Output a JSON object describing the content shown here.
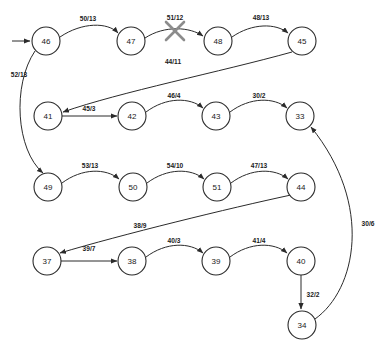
{
  "diagram": {
    "type": "directed-graph",
    "label_format": "cost/capacity",
    "entry_arrow": {
      "target": "46"
    },
    "nodes": [
      {
        "id": "46",
        "label": "46",
        "cx": 46,
        "cy": 41,
        "r": 14
      },
      {
        "id": "47",
        "label": "47",
        "cx": 131,
        "cy": 41,
        "r": 14
      },
      {
        "id": "48",
        "label": "48",
        "cx": 218,
        "cy": 41,
        "r": 14
      },
      {
        "id": "45",
        "label": "45",
        "cx": 302,
        "cy": 41,
        "r": 14
      },
      {
        "id": "41",
        "label": "41",
        "cx": 48,
        "cy": 116,
        "r": 14
      },
      {
        "id": "42",
        "label": "42",
        "cx": 132,
        "cy": 116,
        "r": 14
      },
      {
        "id": "43",
        "label": "43",
        "cx": 216,
        "cy": 116,
        "r": 14
      },
      {
        "id": "33",
        "label": "33",
        "cx": 300,
        "cy": 116,
        "r": 14
      },
      {
        "id": "49",
        "label": "49",
        "cx": 48,
        "cy": 187,
        "r": 14
      },
      {
        "id": "50",
        "label": "50",
        "cx": 133,
        "cy": 187,
        "r": 14
      },
      {
        "id": "51",
        "label": "51",
        "cx": 217,
        "cy": 187,
        "r": 14
      },
      {
        "id": "44",
        "label": "44",
        "cx": 301,
        "cy": 187,
        "r": 14
      },
      {
        "id": "37",
        "label": "37",
        "cx": 47,
        "cy": 261,
        "r": 14
      },
      {
        "id": "38",
        "label": "38",
        "cx": 132,
        "cy": 261,
        "r": 14
      },
      {
        "id": "39",
        "label": "39",
        "cx": 216,
        "cy": 261,
        "r": 14
      },
      {
        "id": "40",
        "label": "40",
        "cx": 301,
        "cy": 261,
        "r": 14
      },
      {
        "id": "34",
        "label": "34",
        "cx": 302,
        "cy": 325,
        "r": 14
      }
    ],
    "edges": [
      {
        "from": "46",
        "to": "47",
        "label": "50/13",
        "lx": 88,
        "ly": 18,
        "path": "M 60,37 C 82,22 108,22 118,33",
        "crossed": false
      },
      {
        "from": "47",
        "to": "48",
        "label": "51/12",
        "lx": 175,
        "ly": 17,
        "path": "M 145,38 C 165,25 190,27 203,36",
        "crossed": true
      },
      {
        "from": "48",
        "to": "45",
        "label": "48/13",
        "lx": 261,
        "ly": 17,
        "path": "M 232,37 C 252,23 276,23 288,33",
        "crossed": false
      },
      {
        "from": "45",
        "to": "41",
        "label": "44/11",
        "lx": 173,
        "ly": 61,
        "path": "M 292,52 C 220,72 120,92 63,112",
        "crossed": false
      },
      {
        "from": "46",
        "to": "49",
        "label": "52/13",
        "lx": 19,
        "ly": 74,
        "path": "M 35,51 C 12,85 16,150 43,173",
        "crossed": false
      },
      {
        "from": "41",
        "to": "42",
        "label": "45/3",
        "lx": 89,
        "ly": 108,
        "path": "M 62,116 L 117,116",
        "crossed": false
      },
      {
        "from": "42",
        "to": "43",
        "label": "46/4",
        "lx": 174,
        "ly": 95,
        "path": "M 146,112 C 166,97 190,97 203,108",
        "crossed": false
      },
      {
        "from": "43",
        "to": "33",
        "label": "30/2",
        "lx": 259,
        "ly": 95,
        "path": "M 230,112 C 250,97 274,97 287,108",
        "crossed": false
      },
      {
        "from": "49",
        "to": "50",
        "label": "53/13",
        "lx": 90,
        "ly": 165,
        "path": "M 62,183 C 82,168 106,168 119,179",
        "crossed": false
      },
      {
        "from": "50",
        "to": "51",
        "label": "54/10",
        "lx": 175,
        "ly": 165,
        "path": "M 147,183 C 167,168 191,168 204,179",
        "crossed": false
      },
      {
        "from": "51",
        "to": "44",
        "label": "47/13",
        "lx": 259,
        "ly": 165,
        "path": "M 231,183 C 251,168 275,168 288,179",
        "crossed": false
      },
      {
        "from": "44",
        "to": "37",
        "label": "38/9",
        "lx": 140,
        "ly": 225,
        "path": "M 291,195 C 230,208 120,235 60,253",
        "crossed": false
      },
      {
        "from": "37",
        "to": "38",
        "label": "39/7",
        "lx": 89,
        "ly": 248,
        "path": "M 61,261 L 117,261",
        "crossed": false
      },
      {
        "from": "38",
        "to": "39",
        "label": "40/3",
        "lx": 174,
        "ly": 240,
        "path": "M 146,257 C 166,242 190,242 203,253",
        "crossed": false
      },
      {
        "from": "39",
        "to": "40",
        "label": "41/4",
        "lx": 259,
        "ly": 240,
        "path": "M 230,257 C 250,242 274,242 287,253",
        "crossed": false
      },
      {
        "from": "40",
        "to": "34",
        "label": "32/2",
        "lx": 313,
        "ly": 294,
        "path": "M 301,275 L 301,309",
        "crossed": false
      },
      {
        "from": "34",
        "to": "33",
        "label": "30/6",
        "lx": 368,
        "ly": 223,
        "path": "M 315,319 C 356,290 374,205 311,127",
        "crossed": false
      }
    ]
  }
}
